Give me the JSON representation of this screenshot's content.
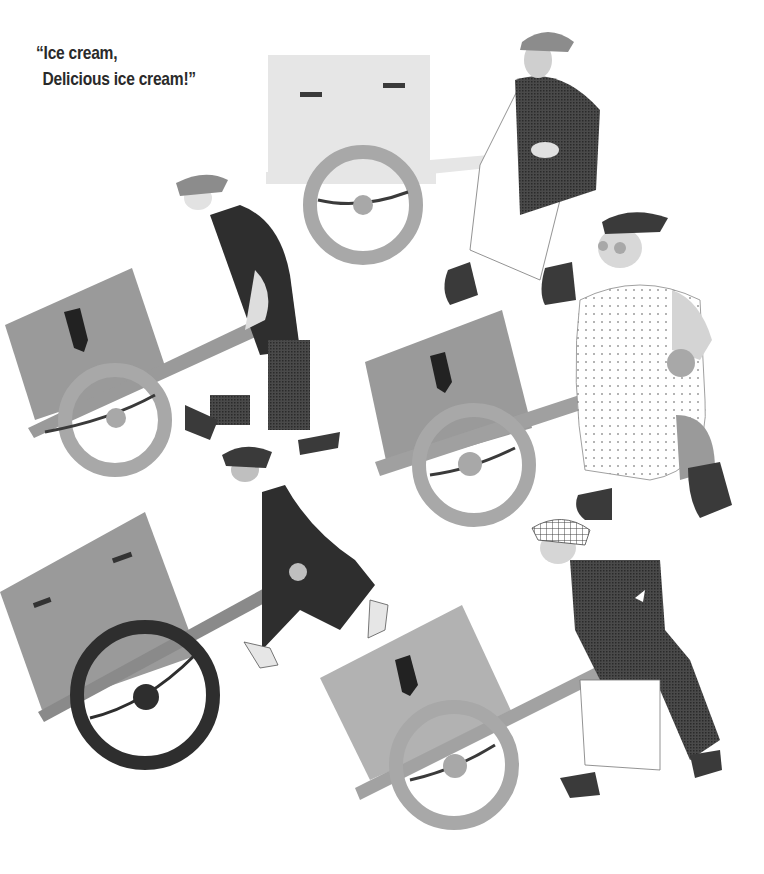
{
  "page": {
    "caption": {
      "line1": "“Ice cream,",
      "line2": "Delicious ice cream!”"
    },
    "colors": {
      "background": "#ffffff",
      "text": "#2a2a2a",
      "cart_light": "#e6e6e6",
      "cart_mid": "#9a9a9a",
      "wheel_mid": "#a8a8a8",
      "dark": "#3a3a3a",
      "coat_dark": "#2e2e2e"
    },
    "illustration": {
      "vendors": [
        {
          "id": "top-center",
          "cart_shade": "light",
          "wheel_shade": "mid"
        },
        {
          "id": "upper-left",
          "cart_shade": "mid",
          "wheel_shade": "mid"
        },
        {
          "id": "middle-right",
          "cart_shade": "mid",
          "wheel_shade": "mid"
        },
        {
          "id": "lower-left",
          "cart_shade": "mid",
          "wheel_shade": "dark"
        },
        {
          "id": "bottom-right",
          "cart_shade": "mid-light",
          "wheel_shade": "mid"
        }
      ]
    }
  }
}
